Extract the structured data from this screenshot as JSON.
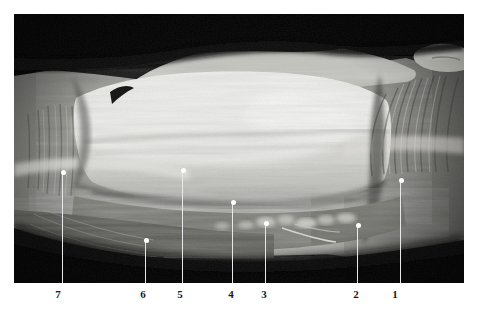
{
  "figure": {
    "kind": "anatomical-dissection-photograph",
    "orientation": "horizontal",
    "background_color": "#ffffff",
    "plate": {
      "background_color": "#000000",
      "left": 14,
      "top": 14,
      "width": 450,
      "height": 269
    },
    "label_color": "#1a1a1a",
    "leader_color": "#e8e8e8",
    "dot_color": "#ffffff"
  },
  "callouts": [
    {
      "label": "7",
      "label_x": 58,
      "label_y": 288,
      "line_x": 62,
      "dot_y": 172,
      "line_bottom": 283
    },
    {
      "label": "6",
      "label_x": 143,
      "label_y": 288,
      "line_x": 145,
      "dot_y": 240,
      "line_bottom": 283
    },
    {
      "label": "5",
      "label_x": 180,
      "label_y": 288,
      "line_x": 182,
      "dot_y": 170,
      "line_bottom": 283
    },
    {
      "label": "4",
      "label_x": 231,
      "label_y": 288,
      "line_x": 232,
      "dot_y": 202,
      "line_bottom": 283
    },
    {
      "label": "3",
      "label_x": 264,
      "label_y": 288,
      "line_x": 265,
      "dot_y": 223,
      "line_bottom": 283
    },
    {
      "label": "2",
      "label_x": 356,
      "label_y": 288,
      "line_x": 357,
      "dot_y": 225,
      "line_bottom": 283
    },
    {
      "label": "1",
      "label_x": 395,
      "label_y": 288,
      "line_x": 400,
      "dot_y": 180,
      "line_bottom": 283
    }
  ]
}
